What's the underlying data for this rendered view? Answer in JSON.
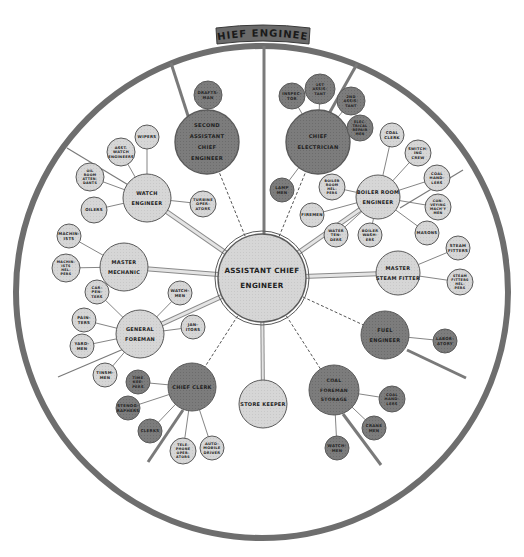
{
  "title": "CHIEF ENGINEER",
  "colors": {
    "background": "#ffffff",
    "ring": "#6e6e6e",
    "spoke": "#7a7a7a",
    "light_fill": "#d6d6d6",
    "dark_fill": "#7c7c7c",
    "center_fill": "#d2d2d2",
    "stroke": "#5a5a5a",
    "thick_link": "#cfcfcf",
    "title_band": "#6a6a6a"
  },
  "center": {
    "id": "ace",
    "lines": [
      "ASSISTANT CHIEF",
      "ENGINEER"
    ]
  },
  "departments": [
    {
      "id": "second-asst",
      "lines": [
        "SECOND",
        "ASSISTANT",
        "CHIEF",
        "ENGINEER"
      ],
      "tone": "dark",
      "link": "dashed",
      "subs": [
        {
          "lines": [
            "DRAFTS-",
            "MAN"
          ],
          "tone": "dark"
        }
      ]
    },
    {
      "id": "chief-electrician",
      "lines": [
        "CHIEF",
        "ELECTRICIAN"
      ],
      "tone": "dark",
      "link": "dashed",
      "subs": [
        {
          "lines": [
            "INSPEC-",
            "TOR"
          ],
          "tone": "dark"
        },
        {
          "lines": [
            "1ST",
            "ASSIS-",
            "TANT"
          ],
          "tone": "dark"
        },
        {
          "lines": [
            "2ND",
            "ASSIS-",
            "TANT"
          ],
          "tone": "dark"
        },
        {
          "lines": [
            "ELEC-",
            "TRICAL",
            "REPAIR",
            "MEN"
          ],
          "tone": "dark"
        },
        {
          "lines": [
            "LAMP",
            "MEN"
          ],
          "tone": "dark"
        }
      ]
    },
    {
      "id": "watch-engineer",
      "lines": [
        "WATCH",
        "ENGINEER"
      ],
      "tone": "light",
      "link": "thick",
      "subs": [
        {
          "lines": [
            "WIPERS"
          ],
          "tone": "light"
        },
        {
          "lines": [
            "ASST.",
            "WATCH",
            "ENGINEERS"
          ],
          "tone": "light"
        },
        {
          "lines": [
            "OIL",
            "ROOM",
            "ATTEN-",
            "DANTS"
          ],
          "tone": "light"
        },
        {
          "lines": [
            "OILERS"
          ],
          "tone": "light"
        },
        {
          "lines": [
            "TURBINE",
            "OPER-",
            "ATORS"
          ],
          "tone": "light"
        }
      ]
    },
    {
      "id": "boiler-room-engineer",
      "lines": [
        "BOILER ROOM",
        "ENGINEER"
      ],
      "tone": "light",
      "link": "thick",
      "subs": [
        {
          "lines": [
            "COAL",
            "CLERK"
          ],
          "tone": "light"
        },
        {
          "lines": [
            "SWITCH-",
            "ING",
            "CREW"
          ],
          "tone": "light"
        },
        {
          "lines": [
            "COAL",
            "HAND-",
            "LERS"
          ],
          "tone": "light"
        },
        {
          "lines": [
            "CON-",
            "VEYING",
            "MACH'Y",
            "MEN"
          ],
          "tone": "light"
        },
        {
          "lines": [
            "MASONS"
          ],
          "tone": "light"
        },
        {
          "lines": [
            "BOILER",
            "WASH-",
            "ERS"
          ],
          "tone": "light"
        },
        {
          "lines": [
            "WATER",
            "TEN-",
            "DERS"
          ],
          "tone": "light"
        },
        {
          "lines": [
            "FIREMEN"
          ],
          "tone": "light"
        },
        {
          "lines": [
            "BOILER",
            "ROOM",
            "HEL-",
            "PERS"
          ],
          "tone": "light"
        }
      ]
    },
    {
      "id": "master-mechanic",
      "lines": [
        "MASTER",
        "MECHANIC"
      ],
      "tone": "light",
      "link": "thick",
      "subs": [
        {
          "lines": [
            "MACHIN-",
            "ISTS"
          ],
          "tone": "light"
        },
        {
          "lines": [
            "MACHIN-",
            "ISTS",
            "HEL-",
            "PERS"
          ],
          "tone": "light"
        }
      ]
    },
    {
      "id": "master-steam-fitter",
      "lines": [
        "MASTER",
        "STEAM FITTER"
      ],
      "tone": "light",
      "link": "thick",
      "subs": [
        {
          "lines": [
            "STEAM",
            "FITTERS"
          ],
          "tone": "light"
        },
        {
          "lines": [
            "STEAM",
            "FITTERS",
            "HEL-",
            "PERS"
          ],
          "tone": "light"
        }
      ]
    },
    {
      "id": "general-foreman",
      "lines": [
        "GENERAL",
        "FOREMAN"
      ],
      "tone": "light",
      "link": "thick",
      "subs": [
        {
          "lines": [
            "CAR-",
            "PEN-",
            "TERS"
          ],
          "tone": "light"
        },
        {
          "lines": [
            "PAIN-",
            "TERS"
          ],
          "tone": "light"
        },
        {
          "lines": [
            "YARD-",
            "MEN"
          ],
          "tone": "light"
        },
        {
          "lines": [
            "TINSM-",
            "MEN"
          ],
          "tone": "light"
        },
        {
          "lines": [
            "WATCH-",
            "MEN"
          ],
          "tone": "light"
        },
        {
          "lines": [
            "JAN-",
            "ITORS"
          ],
          "tone": "light"
        }
      ]
    },
    {
      "id": "fuel-engineer",
      "lines": [
        "FUEL",
        "ENGINEER"
      ],
      "tone": "dark",
      "link": "dashed",
      "subs": [
        {
          "lines": [
            "LABOR-",
            "ATORY"
          ],
          "tone": "dark"
        }
      ]
    },
    {
      "id": "chief-clerk",
      "lines": [
        "CHIEF CLERK"
      ],
      "tone": "dark",
      "link": "dashed",
      "subs": [
        {
          "lines": [
            "TIME",
            "KEE-",
            "PERS"
          ],
          "tone": "dark"
        },
        {
          "lines": [
            "STENOG-",
            "RAPHERS"
          ],
          "tone": "dark"
        },
        {
          "lines": [
            "CLERKS"
          ],
          "tone": "dark"
        },
        {
          "lines": [
            "TELE-",
            "PHONE",
            "OPER-",
            "ATORS"
          ],
          "tone": "light"
        },
        {
          "lines": [
            "AUTO-",
            "MOBILE",
            "DRIVER"
          ],
          "tone": "light"
        }
      ]
    },
    {
      "id": "store-keeper",
      "lines": [
        "STORE KEEPER"
      ],
      "tone": "light",
      "link": "thin",
      "subs": []
    },
    {
      "id": "coal-foreman",
      "lines": [
        "COAL",
        "FOREMAN",
        "STORAGE"
      ],
      "tone": "dark",
      "link": "dashed",
      "subs": [
        {
          "lines": [
            "COAL",
            "HAND-",
            "LERS"
          ],
          "tone": "dark"
        },
        {
          "lines": [
            "CRANE",
            "MEN"
          ],
          "tone": "dark"
        },
        {
          "lines": [
            "WATCH-",
            "MEN"
          ],
          "tone": "dark"
        }
      ]
    }
  ]
}
